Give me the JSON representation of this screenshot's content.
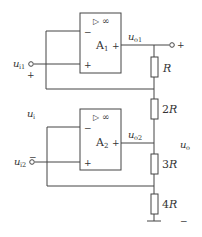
{
  "diagram": {
    "type": "op-amp circuit (instrumentation amplifier style)",
    "amplifiers": [
      {
        "name": "A",
        "sub": "1",
        "symbol": "▷",
        "gain": "∞",
        "inv": "−",
        "noninv": "+",
        "out_sign": "+"
      },
      {
        "name": "A",
        "sub": "2",
        "symbol": "▷",
        "gain": "∞",
        "inv": "−",
        "noninv": "+",
        "out_sign": "+"
      }
    ],
    "inputs": {
      "ui1": {
        "main": "u",
        "sub": "i1",
        "polarity": "+"
      },
      "ui2": {
        "main": "u",
        "sub": "i2",
        "polarity": "−"
      },
      "ui": {
        "main": "u",
        "sub": "i"
      }
    },
    "outputs": {
      "uo1": {
        "main": "u",
        "sub": "o1"
      },
      "uo2": {
        "main": "u",
        "sub": "o2"
      },
      "uo": {
        "main": "u",
        "sub": "o"
      },
      "plus": "+",
      "minus": "−"
    },
    "resistors": [
      {
        "label": "R",
        "coef": ""
      },
      {
        "label": "R",
        "coef": "2"
      },
      {
        "label": "R",
        "coef": "3"
      },
      {
        "label": "R",
        "coef": "4"
      }
    ]
  }
}
